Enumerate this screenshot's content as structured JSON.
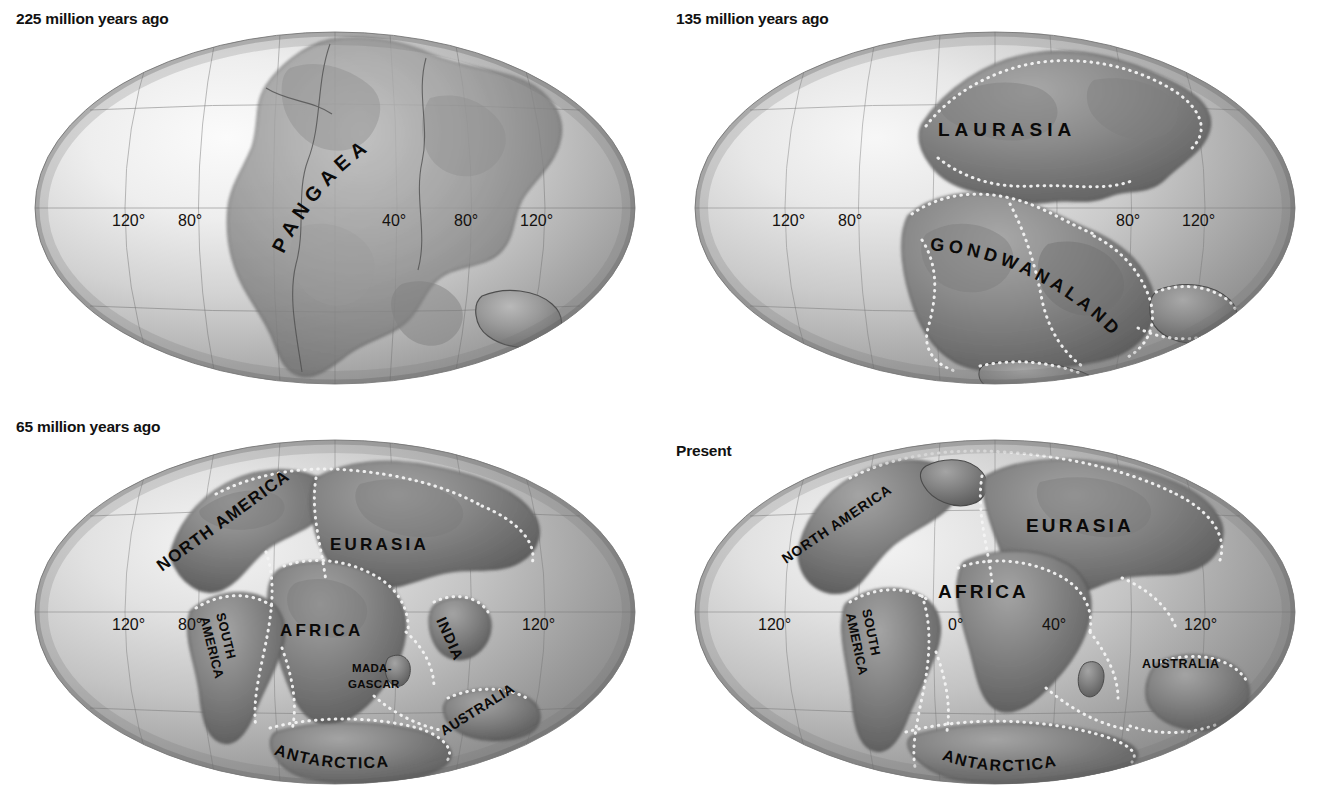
{
  "figure": {
    "kind": "continental-drift-map-series",
    "background": "#ffffff",
    "ink": "#111111",
    "ocean_tone": "#9a9a9a",
    "land_tone": "#6f6f6f",
    "plate_boundary_color": "#f2f2f2",
    "graticule_color": "#6b6b6b"
  },
  "panels": [
    {
      "id": "pangaea",
      "title": "225 million years ago",
      "longitude_labels": [
        "120°",
        "80°",
        "40°",
        "80°",
        "120°"
      ],
      "landmass_labels": [
        {
          "text": "PANGAEA",
          "style": "arc-up"
        }
      ]
    },
    {
      "id": "laurasia-gondwanaland",
      "title": "135 million years ago",
      "longitude_labels": [
        "120°",
        "80°",
        "80°",
        "120°"
      ],
      "landmass_labels": [
        {
          "text": "LAURASIA",
          "style": "straight"
        },
        {
          "text": "GONDWANALAND",
          "style": "arc-down"
        }
      ]
    },
    {
      "id": "sixty-five-ma",
      "title": "65 million years ago",
      "longitude_labels": [
        "120°",
        "80°",
        "120°"
      ],
      "landmass_labels": [
        {
          "text": "NORTH AMERICA",
          "style": "rotated"
        },
        {
          "text": "EURASIA",
          "style": "straight"
        },
        {
          "text": "AFRICA",
          "style": "straight"
        },
        {
          "text": "SOUTH",
          "style": "rotated"
        },
        {
          "text": "AMERICA",
          "style": "rotated"
        },
        {
          "text": "INDIA",
          "style": "rotated"
        },
        {
          "text": "MADA-",
          "style": "straight"
        },
        {
          "text": "GASCAR",
          "style": "straight"
        },
        {
          "text": "AUSTRALIA",
          "style": "rotated"
        },
        {
          "text": "ANTARCTICA",
          "style": "arc"
        }
      ]
    },
    {
      "id": "present",
      "title": "Present",
      "longitude_labels": [
        "120°",
        "0°",
        "40°",
        "120°"
      ],
      "landmass_labels": [
        {
          "text": "NORTH AMERICA",
          "style": "rotated"
        },
        {
          "text": "EURASIA",
          "style": "straight"
        },
        {
          "text": "AFRICA",
          "style": "straight"
        },
        {
          "text": "SOUTH",
          "style": "rotated"
        },
        {
          "text": "AMERICA",
          "style": "rotated"
        },
        {
          "text": "AUSTRALIA",
          "style": "straight"
        },
        {
          "text": "ANTARCTICA",
          "style": "arc"
        }
      ]
    }
  ]
}
